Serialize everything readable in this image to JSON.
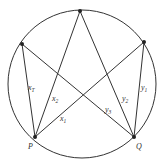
{
  "diagram": {
    "type": "circle-with-inscribed-star",
    "colors": {
      "stroke": "#333333",
      "background": "#ffffff"
    },
    "circle": {
      "cx": 82,
      "cy": 84,
      "r": 74
    },
    "points": {
      "top": {
        "x": 80,
        "y": 11,
        "label": ""
      },
      "upper_left": {
        "x": 22,
        "y": 44,
        "label": ""
      },
      "upper_right": {
        "x": 144,
        "y": 42,
        "label": ""
      },
      "P": {
        "x": 35,
        "y": 137,
        "label": "P"
      },
      "Q": {
        "x": 134,
        "y": 137,
        "label": "Q"
      }
    },
    "labels": {
      "x_T": {
        "base": "x",
        "sub": "T"
      },
      "x_2": {
        "base": "x",
        "sub": "2"
      },
      "x_1": {
        "base": "x",
        "sub": "1"
      },
      "y_3": {
        "base": "y",
        "sub": "3"
      },
      "y_2": {
        "base": "y",
        "sub": "2"
      },
      "y_1": {
        "base": "y",
        "sub": "1"
      }
    }
  }
}
